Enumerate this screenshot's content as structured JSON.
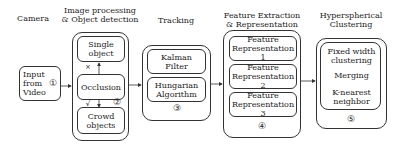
{
  "stages": [
    {
      "title": "Camera",
      "step": "①",
      "items": [
        "Input from Video"
      ]
    },
    {
      "title_line1": "Image processing",
      "title_line2": "& Object detection",
      "step": "②",
      "items": [
        "Single object",
        "Occlusion",
        "Crowd objects"
      ],
      "edge_labels": {
        "to_single": "×",
        "to_crowd": "√"
      }
    },
    {
      "title": "Tracking",
      "step": "③",
      "items": [
        "Kalman Filter",
        "Hungarian Algorithm"
      ]
    },
    {
      "title_line1": "Feature Extraction",
      "title_line2": "& Representation",
      "step": "④",
      "items": [
        "Feature Representation 1",
        "Feature Representation 2",
        "Feature Representation 3"
      ]
    },
    {
      "title_line1": "Hyperspherical",
      "title_line2": "Clustering",
      "step": "⑤",
      "items": [
        "Fixed width clustering",
        "Merging",
        "K-nearest neighbor"
      ]
    }
  ],
  "text": {
    "camera": "Camera",
    "input_l1": "Input",
    "input_l2": "from",
    "input_l3": "Video",
    "step1": "①",
    "ip_l1": "Image processing",
    "ip_l2": "& Object detection",
    "single_l1": "Single",
    "single_l2": "object",
    "occlusion": "Occlusion",
    "crowd_l1": "Crowd",
    "crowd_l2": "objects",
    "x_mark": "×",
    "check_mark": "√",
    "step2": "②",
    "tracking": "Tracking",
    "kalman_l1": "Kalman",
    "kalman_l2": "Filter",
    "hung_l1": "Hungarian",
    "hung_l2": "Algorithm",
    "step3": "③",
    "fe_l1": "Feature Extraction",
    "fe_l2": "& Representation",
    "fr_word": "Feature",
    "fr1": "Representation 1",
    "fr2": "Representation 2",
    "fr3": "Representation 3",
    "step4": "④",
    "hc_l1": "Hyperspherical",
    "hc_l2": "Clustering",
    "fw_l1": "Fixed width",
    "fw_l2": "clustering",
    "merging": "Merging",
    "knn_l1": "K-nearest",
    "knn_l2": "neighbor",
    "step5": "⑤"
  }
}
